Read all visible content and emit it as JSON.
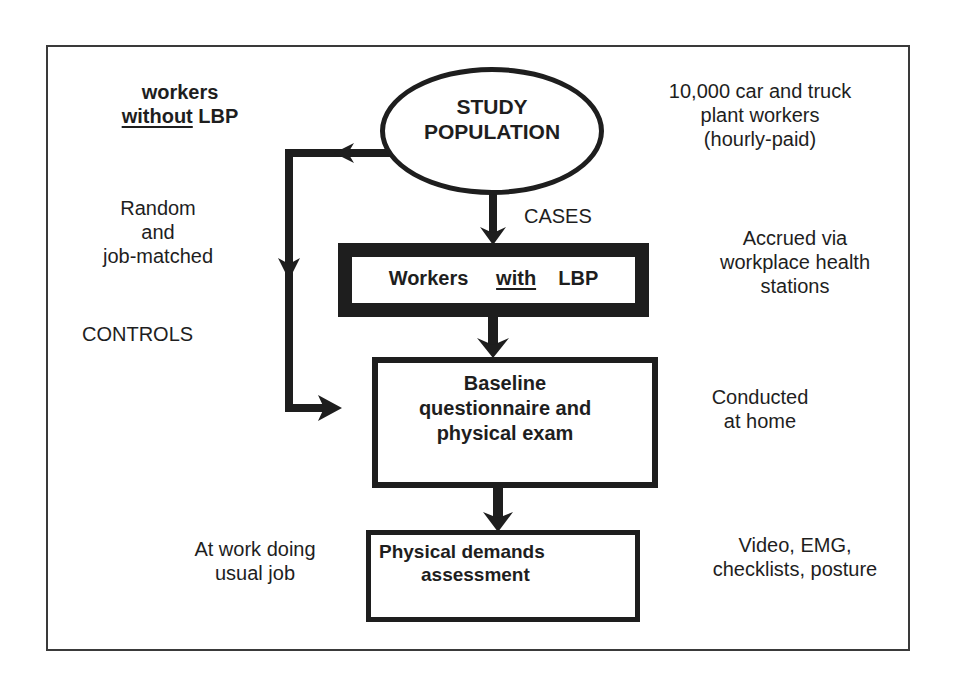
{
  "diagram": {
    "type": "study-design-flowchart",
    "nodes": {
      "study_population": {
        "line1": "STUDY",
        "line2": "POPULATION"
      },
      "workers_with_lbp": {
        "word1": "Workers",
        "word2": "with",
        "word3": "LBP"
      },
      "baseline": {
        "line1": "Baseline",
        "line2": "questionnaire and",
        "line3": "physical exam"
      },
      "physical_demands": {
        "line1": "Physical demands",
        "line2": "assessment"
      }
    },
    "edge_labels": {
      "cases": "CASES",
      "controls": "CONTROLS"
    },
    "left_annotations": {
      "workers_without": {
        "line1": "workers",
        "line2_underlined": "without",
        "line2_rest": "LBP"
      },
      "random_matched": {
        "line1": "Random",
        "line2": "and",
        "line3": "job-matched"
      },
      "at_work": {
        "line1": "At work doing",
        "line2": "usual job"
      }
    },
    "right_annotations": {
      "population_desc": {
        "line1": "10,000 car and truck",
        "line2": "plant workers",
        "line3": "(hourly-paid)"
      },
      "accrued": {
        "line1": "Accrued via",
        "line2": "workplace health",
        "line3": "stations"
      },
      "conducted": {
        "line1": "Conducted",
        "line2": "at home"
      },
      "measures": {
        "line1": "Video, EMG,",
        "line2": "checklists, posture"
      }
    },
    "colors": {
      "ink": "#1e1e1e",
      "background": "#ffffff",
      "frame": "#3a3a3a"
    }
  }
}
